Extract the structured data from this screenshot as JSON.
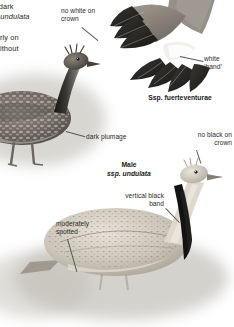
{
  "page": {
    "background": "#ffffff",
    "ink": "#2a2a2a"
  },
  "body_text": {
    "lines": [
      "ted dark",
      "ace undulata",
      "r to",
      "cularly on",
      "n, without"
    ]
  },
  "labels": {
    "no_white_on_crown": "no white on\ncrown",
    "white_hand": "white\n‘hand’",
    "dark_plumage": "dark plumage",
    "no_black_on_crown": "no black on\ncrown",
    "vertical_black_band": "vertical black\nband",
    "moderately_spotted": "moderately\nspotted"
  },
  "captions": {
    "ssp_fuerteventurae": "Ssp. fuerteventurae",
    "male_line1": "Male",
    "male_line2": "ssp. undulata"
  },
  "figures": {
    "dark_bustard": "dark-bustard-standing",
    "wing": "spread-wing-underside",
    "pale_bustard": "pale-bustard-crouching"
  },
  "colors": {
    "dark_plumage": "#3a3a38",
    "pale_plumage": "#cfc8bd",
    "black_band": "#141414",
    "white_hand": "#f2efe9",
    "ground": "#bdb9b1"
  }
}
